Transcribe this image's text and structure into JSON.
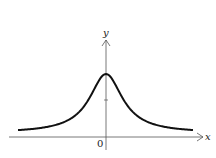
{
  "chart_data": {
    "type": "line",
    "title": "",
    "xlabel": "x",
    "ylabel": "y",
    "x_tick_labels": [
      "0"
    ],
    "function_shape": "bell-shaped curve, y = 1/(1+x^2)",
    "x": [
      -4,
      -3,
      -2,
      -1.5,
      -1,
      -0.5,
      0,
      0.5,
      1,
      1.5,
      2,
      3,
      4
    ],
    "series": [
      {
        "name": "y = 1/(1+x^2)",
        "values": [
          0.059,
          0.1,
          0.2,
          0.308,
          0.5,
          0.8,
          1.0,
          0.8,
          0.5,
          0.308,
          0.2,
          0.1,
          0.059
        ]
      }
    ],
    "grid": false,
    "legend": "none",
    "annotations": []
  },
  "labels": {
    "x_axis": "x",
    "y_axis": "y",
    "origin": "0"
  },
  "colors": {
    "curve": "#111111",
    "axes": "#555555"
  }
}
